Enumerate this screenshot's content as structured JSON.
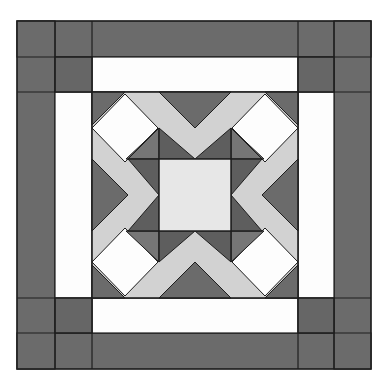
{
  "figure": {
    "colors": {
      "background": "#ffffff",
      "dark": "#6b6b6b",
      "medium_dark": "#5e5e5e",
      "light_band": "#d2d2d2",
      "center_square": "#e7e7e7",
      "white": "#fdfdfd",
      "outline": "#1e1e1e"
    },
    "frame": {
      "outer": {
        "x": 17,
        "y": 21,
        "w": 354,
        "h": 348
      },
      "center_block": {
        "x": 92,
        "y": 92,
        "size": 206
      },
      "border_width": 75,
      "split": 37
    }
  }
}
